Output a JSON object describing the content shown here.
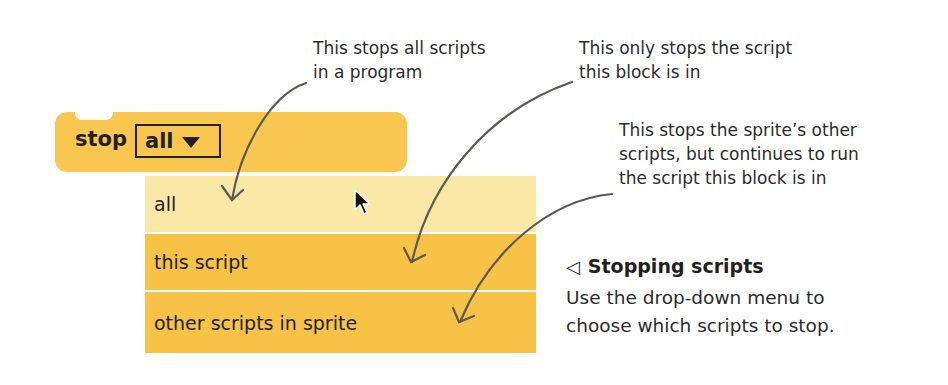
{
  "block": {
    "label": "stop",
    "dropdown_value": "all",
    "color": "#f9c74f"
  },
  "menu": {
    "items": [
      {
        "label": "all",
        "state": "hovered"
      },
      {
        "label": "this script",
        "state": "normal"
      },
      {
        "label": "other scripts in sprite",
        "state": "normal"
      }
    ]
  },
  "annotations": {
    "all_line1": "This stops all scripts",
    "all_line2": "in a program",
    "this_line1": "This only stops the script",
    "this_line2": "this block is in",
    "other_line1": "This stops the sprite’s other",
    "other_line2": "scripts, but continues to run",
    "other_line3": "the script this block is in"
  },
  "caption": {
    "pointer_glyph": "◁",
    "title": "Stopping scripts",
    "line1": "Use the drop-down menu to",
    "line2": "choose which scripts to stop."
  },
  "colors": {
    "block": "#f9c74f",
    "menu_item": "#f8c247",
    "menu_hover": "#fbe8a6",
    "arrow": "#5a5a50"
  }
}
